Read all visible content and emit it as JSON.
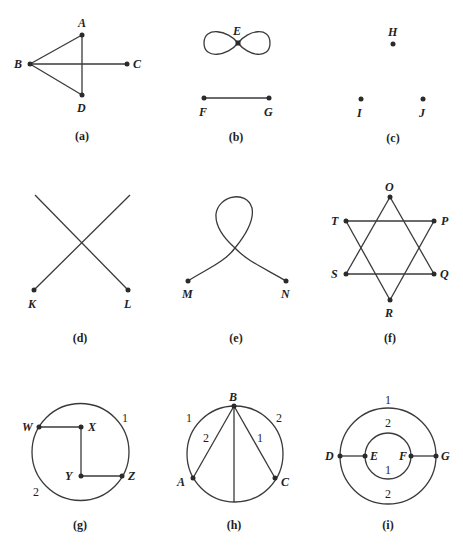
{
  "figure": {
    "panels": [
      {
        "id": "a",
        "caption": "(a)",
        "vertices": {
          "A": "A",
          "B": "B",
          "C": "C",
          "D": "D"
        }
      },
      {
        "id": "b",
        "caption": "(b)",
        "vertices": {
          "E": "E",
          "F": "F",
          "G": "G"
        }
      },
      {
        "id": "c",
        "caption": "(c)",
        "vertices": {
          "H": "H",
          "I": "I",
          "J": "J"
        }
      },
      {
        "id": "d",
        "caption": "(d)",
        "vertices": {
          "K": "K",
          "L": "L"
        }
      },
      {
        "id": "e",
        "caption": "(e)",
        "vertices": {
          "M": "M",
          "N": "N"
        }
      },
      {
        "id": "f",
        "caption": "(f)",
        "vertices": {
          "O": "O",
          "P": "P",
          "Q": "Q",
          "R": "R",
          "S": "S",
          "T": "T"
        }
      },
      {
        "id": "g",
        "caption": "(g)",
        "vertices": {
          "W": "W",
          "X": "X",
          "Y": "Y",
          "Z": "Z"
        },
        "edge_labels": {
          "arc_top_right": "1",
          "arc_bottom_left": "2"
        }
      },
      {
        "id": "h",
        "caption": "(h)",
        "vertices": {
          "A": "A",
          "B": "B",
          "C": "C"
        },
        "edge_labels": {
          "arc_left": "1",
          "arc_right": "2",
          "chord_BA": "2",
          "chord_BC": "1"
        }
      },
      {
        "id": "i",
        "caption": "(i)",
        "vertices": {
          "D": "D",
          "E": "E",
          "F": "F",
          "G": "G"
        },
        "edge_labels": {
          "outer_top": "1",
          "inner_top": "2",
          "inner_bottom": "1",
          "outer_bottom": "2"
        }
      }
    ]
  },
  "colors": {
    "ink": "#2b2b2b",
    "background": "#ffffff"
  }
}
